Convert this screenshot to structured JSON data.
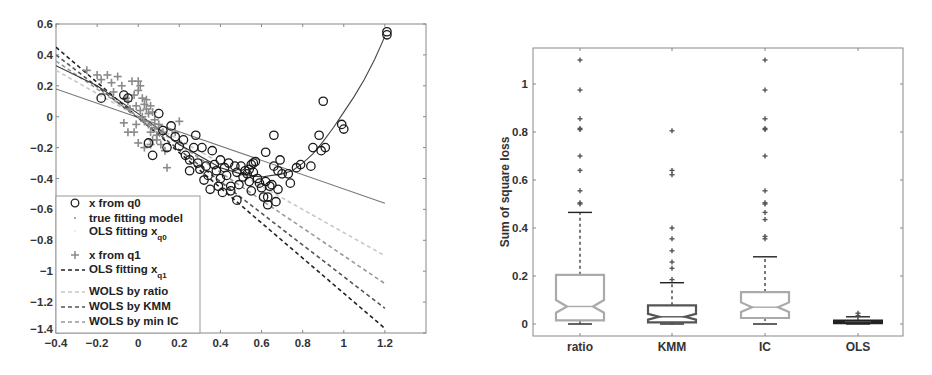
{
  "figure": {
    "panels": [
      "left-scatter-regression",
      "right-boxplot"
    ]
  },
  "chart_data": [
    {
      "type": "scatter",
      "title": "",
      "xlabel": "",
      "ylabel": "",
      "xlim": [
        -0.4,
        1.4
      ],
      "ylim": [
        -1.4,
        0.6
      ],
      "grid": false,
      "xticks": [
        -0.4,
        -0.2,
        0,
        0.2,
        0.4,
        0.6,
        0.8,
        1,
        1.2
      ],
      "xtick_labels": [
        "-0.4",
        "-0.2",
        "0",
        "0.2",
        "0.4",
        "0.6",
        "0.8",
        "1",
        "1.2"
      ],
      "yticks": [
        0.6,
        0.4,
        0.2,
        0,
        -0.2,
        -0.4,
        -0.6,
        -0.8,
        -1,
        -1.2,
        -1.4
      ],
      "ytick_labels": [
        "0.6",
        "0.4",
        "0.2",
        "0",
        "-0.2",
        "-0.4",
        "-0.6",
        "-0.8",
        "-1",
        "-1.2",
        "-1.4"
      ],
      "legend_position": "lower left",
      "legend": [
        {
          "label": "x from q0",
          "marker": "circle",
          "color": "#222222"
        },
        {
          "label": "true fitting model",
          "marker": "dot",
          "color": "#333333"
        },
        {
          "label": "OLS fitting x",
          "sub": "q0",
          "line": "solid",
          "color": "#777777"
        },
        {
          "label": "x from q1",
          "marker": "plus",
          "color": "#888888"
        },
        {
          "label": "OLS fitting x",
          "sub": "q1",
          "line": "dashed",
          "color": "#222222"
        },
        {
          "label": "WOLS by ratio",
          "line": "dashed",
          "color": "#c8c8c8"
        },
        {
          "label": "WOLS by KMM",
          "line": "dashed",
          "color": "#555555"
        },
        {
          "label": "WOLS by min IC",
          "line": "dashed",
          "color": "#999999"
        }
      ],
      "series": [
        {
          "name": "x from q0",
          "kind": "points",
          "marker": "circle",
          "points": [
            [
              -0.18,
              0.12
            ],
            [
              -0.07,
              0.14
            ],
            [
              -0.05,
              0.12
            ],
            [
              0.1,
              0.02
            ],
            [
              0.05,
              -0.17
            ],
            [
              0.07,
              -0.25
            ],
            [
              0.16,
              -0.06
            ],
            [
              0.12,
              -0.09
            ],
            [
              0.14,
              -0.2
            ],
            [
              0.18,
              -0.13
            ],
            [
              0.2,
              -0.19
            ],
            [
              0.22,
              -0.15
            ],
            [
              0.23,
              -0.25
            ],
            [
              0.25,
              -0.28
            ],
            [
              0.25,
              -0.35
            ],
            [
              0.27,
              -0.2
            ],
            [
              0.28,
              -0.12
            ],
            [
              0.29,
              -0.3
            ],
            [
              0.3,
              -0.34
            ],
            [
              0.31,
              -0.2
            ],
            [
              0.32,
              -0.41
            ],
            [
              0.33,
              -0.32
            ],
            [
              0.34,
              -0.38
            ],
            [
              0.35,
              -0.47
            ],
            [
              0.36,
              -0.22
            ],
            [
              0.37,
              -0.31
            ],
            [
              0.38,
              -0.35
            ],
            [
              0.39,
              -0.45
            ],
            [
              0.4,
              -0.4
            ],
            [
              0.4,
              -0.28
            ],
            [
              0.41,
              -0.49
            ],
            [
              0.42,
              -0.33
            ],
            [
              0.43,
              -0.38
            ],
            [
              0.44,
              -0.3
            ],
            [
              0.45,
              -0.45
            ],
            [
              0.45,
              -0.48
            ],
            [
              0.47,
              -0.32
            ],
            [
              0.48,
              -0.36
            ],
            [
              0.48,
              -0.54
            ],
            [
              0.49,
              -0.44
            ],
            [
              0.5,
              -0.32
            ],
            [
              0.51,
              -0.39
            ],
            [
              0.52,
              -0.35
            ],
            [
              0.53,
              -0.37
            ],
            [
              0.54,
              -0.34
            ],
            [
              0.54,
              -0.42
            ],
            [
              0.55,
              -0.31
            ],
            [
              0.55,
              -0.48
            ],
            [
              0.56,
              -0.3
            ],
            [
              0.56,
              -0.36
            ],
            [
              0.57,
              -0.29
            ],
            [
              0.58,
              -0.4
            ],
            [
              0.59,
              -0.43
            ],
            [
              0.6,
              -0.46
            ],
            [
              0.61,
              -0.52
            ],
            [
              0.62,
              -0.42
            ],
            [
              0.62,
              -0.23
            ],
            [
              0.63,
              -0.57
            ],
            [
              0.63,
              -0.52
            ],
            [
              0.64,
              -0.45
            ],
            [
              0.65,
              -0.44
            ],
            [
              0.66,
              -0.12
            ],
            [
              0.66,
              -0.32
            ],
            [
              0.67,
              -0.55
            ],
            [
              0.68,
              -0.47
            ],
            [
              0.68,
              -0.35
            ],
            [
              0.69,
              -0.28
            ],
            [
              0.7,
              -0.37
            ],
            [
              0.73,
              -0.37
            ],
            [
              0.74,
              -0.43
            ],
            [
              0.77,
              -0.33
            ],
            [
              0.79,
              -0.31
            ],
            [
              0.84,
              -0.32
            ],
            [
              0.85,
              -0.2
            ],
            [
              0.88,
              -0.12
            ],
            [
              0.89,
              -0.22
            ],
            [
              0.9,
              0.1
            ],
            [
              0.91,
              -0.2
            ],
            [
              0.99,
              -0.05
            ],
            [
              1.0,
              -0.08
            ],
            [
              1.21,
              0.55
            ],
            [
              1.21,
              0.53
            ]
          ]
        },
        {
          "name": "x from q1",
          "kind": "points",
          "marker": "plus",
          "points": [
            [
              -0.25,
              0.3
            ],
            [
              -0.2,
              0.27
            ],
            [
              -0.18,
              0.24
            ],
            [
              -0.15,
              0.27
            ],
            [
              -0.13,
              0.22
            ],
            [
              -0.12,
              0.16
            ],
            [
              -0.1,
              0.26
            ],
            [
              -0.08,
              0.2
            ],
            [
              -0.06,
              0.12
            ],
            [
              -0.05,
              0.1
            ],
            [
              -0.03,
              0.23
            ],
            [
              -0.02,
              0.14
            ],
            [
              -0.01,
              0.07
            ],
            [
              0.0,
              0.23
            ],
            [
              0.0,
              0.17
            ],
            [
              0.01,
              0.2
            ],
            [
              0.01,
              0.04
            ],
            [
              0.02,
              0.12
            ],
            [
              0.02,
              0.0
            ],
            [
              0.03,
              0.08
            ],
            [
              0.03,
              -0.03
            ],
            [
              0.04,
              0.05
            ],
            [
              0.04,
              0.11
            ],
            [
              0.05,
              0.02
            ],
            [
              0.05,
              -0.05
            ],
            [
              0.06,
              0.07
            ],
            [
              0.06,
              -0.1
            ],
            [
              0.07,
              0.03
            ],
            [
              0.07,
              -0.15
            ],
            [
              0.08,
              -0.02
            ],
            [
              0.08,
              -0.07
            ],
            [
              0.09,
              -0.12
            ],
            [
              0.1,
              -0.05
            ],
            [
              0.11,
              -0.18
            ],
            [
              0.12,
              -0.1
            ],
            [
              0.13,
              -0.22
            ],
            [
              0.14,
              -0.33
            ],
            [
              0.2,
              -0.03
            ],
            [
              0.18,
              -0.1
            ],
            [
              0.0,
              -0.17
            ],
            [
              -0.02,
              -0.1
            ],
            [
              -0.05,
              -0.1
            ],
            [
              -0.07,
              -0.04
            ],
            [
              0.03,
              -0.2
            ],
            [
              0.06,
              -0.18
            ],
            [
              0.09,
              -0.15
            ],
            [
              -0.04,
              0.05
            ],
            [
              -0.01,
              -0.05
            ]
          ]
        },
        {
          "name": "true fitting model",
          "kind": "curve",
          "style": "dotted-solid",
          "color": "#444444",
          "points": [
            [
              0.7,
              -0.37
            ],
            [
              0.75,
              -0.35
            ],
            [
              0.8,
              -0.3
            ],
            [
              0.85,
              -0.24
            ],
            [
              0.9,
              -0.16
            ],
            [
              0.95,
              -0.07
            ],
            [
              1.0,
              0.03
            ],
            [
              1.05,
              0.13
            ],
            [
              1.1,
              0.24
            ],
            [
              1.15,
              0.37
            ],
            [
              1.2,
              0.52
            ]
          ]
        },
        {
          "name": "OLS fitting x_q0",
          "kind": "line",
          "style": "solid",
          "color": "#777777",
          "points": [
            [
              -0.4,
              0.18
            ],
            [
              1.2,
              -0.56
            ]
          ]
        },
        {
          "name": "OLS fitting x_q1",
          "kind": "line",
          "style": "dashed",
          "color": "#222222",
          "points": [
            [
              -0.4,
              0.45
            ],
            [
              1.2,
              -1.37
            ]
          ]
        },
        {
          "name": "WOLS by ratio",
          "kind": "line",
          "style": "dashed",
          "color": "#c8c8c8",
          "points": [
            [
              -0.4,
              0.3
            ],
            [
              1.2,
              -0.9
            ]
          ]
        },
        {
          "name": "WOLS by KMM",
          "kind": "line",
          "style": "dashed",
          "color": "#555555",
          "points": [
            [
              -0.4,
              0.4
            ],
            [
              1.2,
              -1.24
            ]
          ]
        },
        {
          "name": "WOLS by min IC",
          "kind": "line",
          "style": "dashed",
          "color": "#999999",
          "points": [
            [
              -0.4,
              0.36
            ],
            [
              1.2,
              -1.08
            ]
          ]
        },
        {
          "name": "smooth fit (dark)",
          "kind": "line",
          "style": "solid",
          "color": "#333333",
          "points": [
            [
              -0.4,
              0.33
            ],
            [
              -0.2,
              0.2
            ],
            [
              0.0,
              0.02
            ],
            [
              0.2,
              -0.18
            ],
            [
              0.4,
              -0.33
            ],
            [
              0.5,
              -0.37
            ],
            [
              0.6,
              -0.39
            ],
            [
              0.7,
              -0.37
            ]
          ]
        }
      ]
    },
    {
      "type": "box",
      "title": "",
      "xlabel": "",
      "ylabel": "Sum of square loss",
      "ylim": [
        -0.05,
        1.15
      ],
      "grid": false,
      "categories": [
        "ratio",
        "KMM",
        "IC",
        "OLS"
      ],
      "yticks": [
        0,
        0.2,
        0.4,
        0.6,
        0.8,
        1
      ],
      "ytick_labels": [
        "0",
        "0.2",
        "0.4",
        "0.6",
        "0.8",
        "1"
      ],
      "notched": true,
      "series": [
        {
          "name": "ratio",
          "color": "#aaaaaa",
          "q1": 0.015,
          "median": 0.073,
          "q3": 0.205,
          "notch_low": 0.047,
          "notch_high": 0.1,
          "whisker_low": 0.0,
          "whisker_high": 0.465,
          "outliers": [
            0.5,
            0.505,
            0.555,
            0.64,
            0.7,
            0.81,
            0.815,
            0.855,
            0.975,
            1.1
          ]
        },
        {
          "name": "KMM",
          "color": "#555555",
          "q1": 0.007,
          "median": 0.03,
          "q3": 0.078,
          "notch_low": 0.018,
          "notch_high": 0.042,
          "whisker_low": 0.0,
          "whisker_high": 0.172,
          "outliers": [
            0.185,
            0.232,
            0.258,
            0.305,
            0.355,
            0.4,
            0.622,
            0.64,
            0.805
          ]
        },
        {
          "name": "IC",
          "color": "#aaaaaa",
          "q1": 0.025,
          "median": 0.07,
          "q3": 0.133,
          "notch_low": 0.05,
          "notch_high": 0.09,
          "whisker_low": 0.0,
          "whisker_high": 0.28,
          "outliers": [
            0.355,
            0.365,
            0.435,
            0.465,
            0.5,
            0.505,
            0.555,
            0.7,
            0.81,
            0.815,
            0.855,
            0.975,
            1.1
          ]
        },
        {
          "name": "OLS",
          "color": "#222222",
          "q1": 0.003,
          "median": 0.008,
          "q3": 0.015,
          "notch_low": 0.006,
          "notch_high": 0.01,
          "whisker_low": 0.0,
          "whisker_high": 0.03,
          "outliers": [
            0.035,
            0.045
          ]
        }
      ]
    }
  ]
}
